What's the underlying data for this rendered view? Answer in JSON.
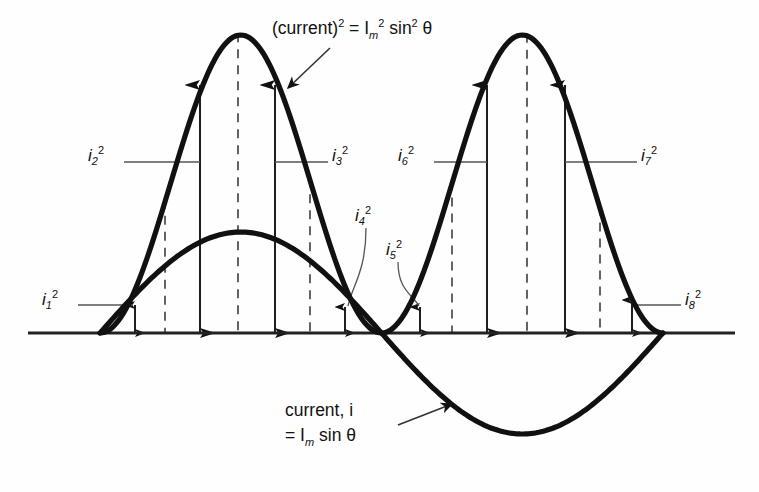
{
  "figure": {
    "type": "diagram",
    "background_color": "#fefefe",
    "curve_color": "#111111",
    "axis_color": "#333333",
    "arrow_color": "#111111",
    "leader_color": "#555555"
  },
  "labels": {
    "squared_curve": {
      "name": "squared-curve-label",
      "text_parts": {
        "base": "(current)",
        "exp1": "2",
        "eq": " = ",
        "im": "I",
        "im_sub": "m",
        "im_exp": "2",
        "sin": " sin",
        "sin_exp": "2",
        "theta": "θ"
      },
      "full_text": "(current)2 = Im2 sin2 θ",
      "x": 272,
      "y": 25
    },
    "sine_curve": {
      "name": "sine-curve-label",
      "line1_parts": {
        "text": "current, ",
        "sym": "i"
      },
      "line2_parts": {
        "eq": "= ",
        "im": "I",
        "im_sub": "m",
        "sin": " sin ",
        "theta": "θ"
      },
      "line1": "current, i",
      "line2": "= Im sin θ",
      "x": 285,
      "y": 405
    }
  },
  "chart_data": {
    "type": "line",
    "title": "(current)2 = Im2 sin2 θ",
    "xlabel": "θ",
    "ylabel": "current / (current)²",
    "grid": false,
    "legend": "none",
    "x_range_deg": [
      0,
      360
    ],
    "baseline_y_px": 333,
    "series": [
      {
        "name": "current, i = Im sin θ",
        "kind": "sine",
        "color": "#111111",
        "peak_px": {
          "x": 238,
          "y": 232
        },
        "trough_px": {
          "x": 527,
          "y": 430
        },
        "zero_crossings_px": [
          100,
          385,
          663
        ]
      },
      {
        "name": "(current)2 = Im2 sin2 θ",
        "kind": "sine-squared",
        "color": "#111111",
        "peaks_px": [
          {
            "x": 238,
            "y": 35
          },
          {
            "x": 527,
            "y": 35
          }
        ],
        "zeros_px": [
          100,
          385,
          663
        ]
      }
    ],
    "samples": [
      {
        "id": "i1",
        "label": "i",
        "sub": "1",
        "exp": "2",
        "x_px": 135,
        "top_px": 305,
        "kind": "short"
      },
      {
        "id": "i2",
        "label": "i",
        "sub": "2",
        "exp": "2",
        "x_px": 200,
        "top_px": 85,
        "kind": "tall"
      },
      {
        "id": "i3",
        "label": "i",
        "sub": "3",
        "exp": "2",
        "x_px": 275,
        "top_px": 85,
        "kind": "tall"
      },
      {
        "id": "i4",
        "label": "i",
        "sub": "4",
        "exp": "2",
        "x_px": 345,
        "top_px": 307,
        "kind": "short"
      },
      {
        "id": "i5",
        "label": "i",
        "sub": "5",
        "exp": "2",
        "x_px": 420,
        "top_px": 307,
        "kind": "short"
      },
      {
        "id": "i6",
        "label": "i",
        "sub": "6",
        "exp": "2",
        "x_px": 487,
        "top_px": 85,
        "kind": "tall"
      },
      {
        "id": "i7",
        "label": "i",
        "sub": "7",
        "exp": "2",
        "x_px": 565,
        "top_px": 85,
        "kind": "tall"
      },
      {
        "id": "i8",
        "label": "i",
        "sub": "8",
        "exp": "2",
        "x_px": 632,
        "top_px": 300,
        "kind": "short"
      }
    ],
    "dashed_verticals_px": [
      165,
      238,
      310,
      452,
      527,
      600
    ],
    "annotations": [
      {
        "name": "label-i1",
        "text": "i1 2",
        "x": 42,
        "y": 290,
        "leader_to_x": 133,
        "leader_y": 305
      },
      {
        "name": "label-i2",
        "text": "i2 2",
        "x": 88,
        "y": 146,
        "leader_to_x": 200,
        "leader_y": 162
      },
      {
        "name": "label-i3",
        "text": "i3 2",
        "x": 332,
        "y": 146,
        "leader_to_x": 275,
        "leader_y": 162
      },
      {
        "name": "label-i4",
        "text": "i4 2",
        "x": 355,
        "y": 206,
        "leader_to_x": 347,
        "leader_y": 312
      },
      {
        "name": "label-i5",
        "text": "i5 2",
        "x": 386,
        "y": 240,
        "leader_to_x": 420,
        "leader_y": 312
      },
      {
        "name": "label-i6",
        "text": "i6 2",
        "x": 398,
        "y": 146,
        "leader_to_x": 487,
        "leader_y": 162
      },
      {
        "name": "label-i7",
        "text": "i7 2",
        "x": 641,
        "y": 146,
        "leader_to_x": 565,
        "leader_y": 162
      },
      {
        "name": "label-i8",
        "text": "i8 2",
        "x": 685,
        "y": 290,
        "leader_to_x": 634,
        "leader_y": 305
      }
    ]
  }
}
